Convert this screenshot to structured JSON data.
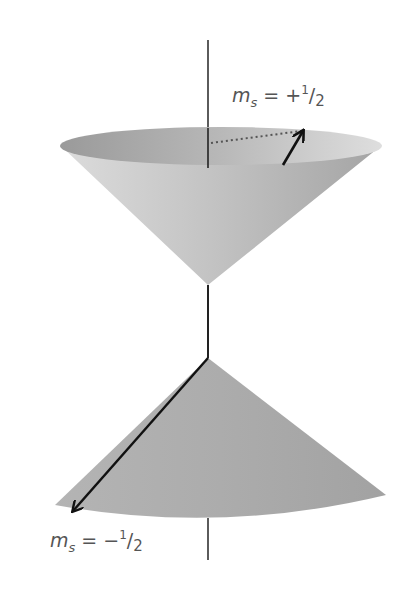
{
  "figure": {
    "colors": {
      "background": "#ffffff",
      "axis": "#333333",
      "arrow": "#111111",
      "upper_cone_light": "#d9d9d9",
      "upper_cone_dark": "#a6a6a6",
      "upper_cap_dark": "#9c9c9c",
      "upper_cap_light": "#d4d4d4",
      "lower_cone": "#ababab",
      "label": "#555555"
    }
  },
  "labels": {
    "spin_up": {
      "symbol": "m",
      "subscript": "s",
      "equals": " = +",
      "numerator": "1",
      "slash": "/",
      "denominator": "2"
    },
    "spin_down": {
      "symbol": "m",
      "subscript": "s",
      "equals": " = −",
      "numerator": "1",
      "slash": "/",
      "denominator": "2"
    }
  }
}
